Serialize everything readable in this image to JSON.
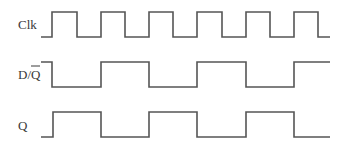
{
  "diagram": {
    "type": "timing-diagram",
    "line_color": "#555555",
    "label_color": "#3a3a3a",
    "signals": [
      {
        "name": "Clk",
        "label": "Clk",
        "label_parts": {
          "main": "Clk",
          "overlined": ""
        },
        "high_y": 12,
        "low_y": 37,
        "start_x": 41,
        "end_x": 330,
        "initial_level": "low",
        "edges_x": [
          52,
          77,
          101,
          125,
          149,
          173,
          197,
          222,
          246,
          270,
          294,
          318
        ]
      },
      {
        "name": "D/Q-bar",
        "label": "D/Q̄",
        "label_parts": {
          "main": "D/",
          "overlined": "Q"
        },
        "high_y": 62,
        "low_y": 87,
        "start_x": 41,
        "end_x": 330,
        "initial_level": "high",
        "edges_x": [
          52,
          101,
          149,
          197,
          246,
          294
        ]
      },
      {
        "name": "Q",
        "label": "Q",
        "label_parts": {
          "main": "Q",
          "overlined": ""
        },
        "high_y": 112,
        "low_y": 137,
        "start_x": 41,
        "end_x": 330,
        "initial_level": "low",
        "edges_x": [
          53,
          101,
          149,
          197,
          246,
          294
        ]
      }
    ]
  }
}
